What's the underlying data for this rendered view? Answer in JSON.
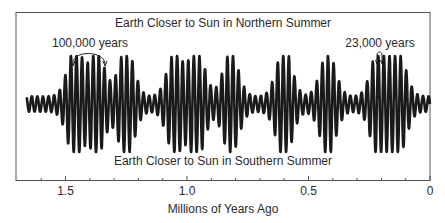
{
  "chart_data": {
    "type": "line",
    "title": "",
    "top_label": "Earth Closer to Sun in Northern Summer",
    "bottom_label": "Earth Closer to Sun in Southern Summer",
    "xlabel": "Millions of Years Ago",
    "ylabel": "",
    "xlim": [
      1.68,
      0
    ],
    "x_ticks_major": [
      1.5,
      1.0,
      0.5,
      0
    ],
    "x_tick_labels": [
      "1.5",
      "1.0",
      "0.5",
      "0"
    ],
    "x_ticks_minor_step": 0.1,
    "grid": false,
    "legend": null,
    "annotations": [
      {
        "text": "100,000 years",
        "span_my": [
          1.47,
          1.34
        ],
        "label_x_my": 1.54
      },
      {
        "text": "23,000 years",
        "span_my": [
          0.221,
          0.203
        ],
        "label_x_my": 0.17
      }
    ],
    "series": [
      {
        "name": "Precession index (Earth–Sun distance in summer)",
        "start_my": 1.66,
        "end_my": 0.0,
        "precession_period_kyr": 23,
        "eccentricity_period_kyr": 100,
        "envelope_peaks_my": [
          1.46,
          1.37,
          1.25,
          1.05,
          0.96,
          0.82,
          0.6,
          0.42,
          0.21,
          0.13
        ],
        "relative_amplitude_range": [
          0.15,
          1.0
        ]
      }
    ]
  },
  "colors": {
    "line": "#1a1a1a",
    "frame": "#555555",
    "background": "#ffffff"
  }
}
